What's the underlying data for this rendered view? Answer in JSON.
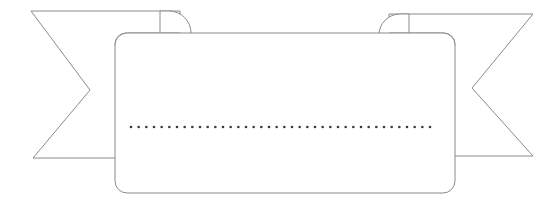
{
  "graphic": {
    "name": "ribbon-banner",
    "type": "decorative-banner",
    "title": "",
    "caption_text": "",
    "description": "Blank ribbon banner with swallowtail tails and a dotted placeholder line",
    "canvas": {
      "width": 559,
      "height": 206
    },
    "colors": {
      "background": "#ffffff",
      "panel_fill": "#ffffff",
      "fold_fill": "#d2d2d2",
      "stroke": "#8a8a8a",
      "dot_color": "#3a3a3a"
    },
    "stroke_width": 1,
    "panel": {
      "name": "main-panel",
      "x": 115,
      "y": 33,
      "width": 340,
      "height": 160,
      "corner_radius": 12,
      "label": ""
    },
    "left_tail": {
      "name": "left-tail",
      "points": "31,11 180,11 180,158 33,158 90,90",
      "top_y": 11,
      "bottom_y": 158,
      "notch_x": 90,
      "notch_y": 90,
      "outer_x": 31
    },
    "right_tail": {
      "name": "right-tail",
      "points": "533,14 389,14 389,156 533,156 472,88",
      "top_y": 14,
      "bottom_y": 156,
      "notch_x": 472,
      "notch_y": 88,
      "outer_x": 533
    },
    "left_fold": {
      "name": "left-fold",
      "x": 115,
      "y": 33,
      "width": 65,
      "height": 22,
      "radius": 11
    },
    "right_fold": {
      "name": "right-fold",
      "x": 389,
      "y": 33,
      "width": 66,
      "height": 22,
      "radius": 11
    },
    "dotted_line": {
      "name": "dotted-placeholder-line",
      "y": 127,
      "x_start": 131,
      "x_end": 430,
      "dot_count": 40,
      "dot_radius": 1.3,
      "spacing": 7.67,
      "text": ""
    }
  }
}
